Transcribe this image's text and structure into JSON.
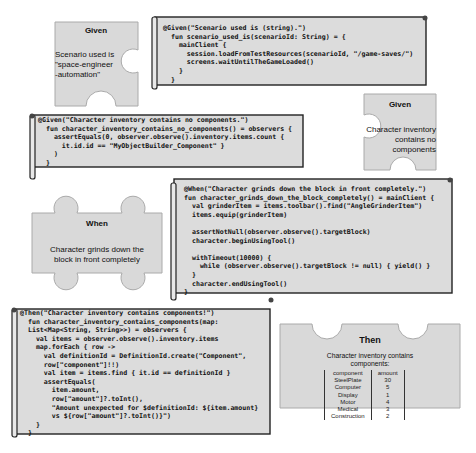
{
  "colors": {
    "piece_fill": "#d9d9d9",
    "piece_stroke": "#aaaaaa",
    "scroll_fill": "#dcdcdc",
    "scroll_stroke": "#222222",
    "text": "#111111"
  },
  "pieces": {
    "given_scenario": {
      "title": "Given",
      "text_lines": [
        "Scenario used is",
        "\"space-engineer",
        "-automation\""
      ]
    },
    "given_inventory": {
      "title": "Given",
      "text_lines": [
        "Character inventory",
        "contains no components"
      ]
    },
    "when_grind": {
      "title": "When",
      "text_lines": [
        "Character grinds down the",
        "block in front completely"
      ]
    },
    "then_components": {
      "title": "Then",
      "text_lines": [
        "Character inventory contains",
        "components:"
      ],
      "table": {
        "headers": [
          "component",
          "amount"
        ],
        "rows": [
          [
            "SteelPlate",
            "30"
          ],
          [
            "Computer",
            "5"
          ],
          [
            "Display",
            "1"
          ],
          [
            "Motor",
            "4"
          ],
          [
            "Medical",
            "3"
          ],
          [
            "Construction",
            "2"
          ]
        ]
      }
    }
  },
  "scrolls": {
    "given_scenario_code": "@Given(\"Scenario used is (string).\")\n  fun scenario_used_is(scenarioId: String) = {\n    mainClient {\n      session.loadFromTestResources(scenarioId, \"/game-saves/\")\n      screens.waitUntilTheGameLoaded()\n    }\n  }",
    "given_inventory_code": "@Given(\"Character inventory contains no components.\")\n  fun character_inventory_contains_no_components() = observers {\n    assertEquals(0, observer.observe().inventory.items.count {\n      it.id.id == \"MyObjectBuilder_Component\" }\n    )\n  }",
    "when_grind_code": "@When(\"Character grinds down the block in front completely.\")\nfun character_grinds_down_the_block_completely() = mainClient {\n  val grinderItem = items.toolbar().find(\"AngleGrinderItem\")\n  items.equip(grinderItem)\n\n  assertNotNull(observer.observe().targetBlock)\n  character.beginUsingTool()\n\n  withTimeout(10000) {\n    while (observer.observe().targetBlock != null) { yield() }\n  }\n  character.endUsingTool()\n}",
    "then_components_code": "@Then(\"Character inventory contains components!\")\n  fun character_inventory_contains_components(map:\n  List<Map<String, String>>) = observers {\n    val items = observer.observe().inventory.items\n    map.forEach { row ->\n      val definitionId = DefinitionId.create(\"Component\",\n      row[\"component\"]!!)\n      val item = items.find { it.id == definitionId }\n      assertEquals(\n        item.amount,\n        row[\"amount\"]?.toInt(),\n        \"Amount unexpected for $definitionId: ${item.amount}\n        vs ${row[\"amount\"]?.toInt()}\")\n    }\n  }"
  }
}
